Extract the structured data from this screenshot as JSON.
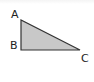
{
  "diagram": {
    "type": "right-triangle",
    "fill_color": "#c8c8c8",
    "stroke_color": "#333333",
    "vertices": [
      {
        "label": "A",
        "x": 21,
        "y": 20
      },
      {
        "label": "B",
        "x": 21,
        "y": 50
      },
      {
        "label": "C",
        "x": 80,
        "y": 50
      }
    ],
    "right_angle_at": "B",
    "labels": {
      "a": "A",
      "b": "B",
      "c": "C"
    }
  }
}
